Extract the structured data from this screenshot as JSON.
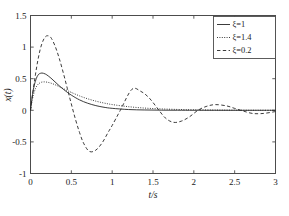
{
  "chart_data": {
    "type": "line",
    "title": "",
    "xlabel": "t/s",
    "ylabel": "x(t)",
    "xlim": [
      0,
      3
    ],
    "ylim": [
      -1,
      1.5
    ],
    "grid": false,
    "legend_position": "upper-right",
    "xticks": [
      "0",
      "0.5",
      "1",
      "1.5",
      "2",
      "2.5",
      "3"
    ],
    "xtick_values": [
      0,
      0.5,
      1,
      1.5,
      2,
      2.5,
      3
    ],
    "yticks": [
      "1.5",
      "1",
      "0.5",
      "0",
      "-0.5",
      "-1"
    ],
    "ytick_values": [
      1.5,
      1,
      0.5,
      0,
      -0.5,
      -1
    ],
    "series": [
      {
        "name": "ξ=1",
        "zeta": 1,
        "style": "solid",
        "color": "#262626",
        "peak_value": 0.59,
        "peak_time": 0.14,
        "x": [
          0,
          0.02,
          0.04,
          0.06,
          0.08,
          0.1,
          0.12,
          0.14,
          0.16,
          0.18,
          0.2,
          0.25,
          0.3,
          0.35,
          0.4,
          0.45,
          0.5,
          0.6,
          0.7,
          0.8,
          0.9,
          1.0,
          1.2,
          1.4,
          1.6,
          1.8,
          2.0,
          2.25,
          2.5,
          2.75,
          3.0
        ],
        "y": [
          0,
          0.21,
          0.36,
          0.46,
          0.53,
          0.57,
          0.585,
          0.59,
          0.585,
          0.575,
          0.56,
          0.51,
          0.45,
          0.39,
          0.335,
          0.285,
          0.24,
          0.165,
          0.112,
          0.074,
          0.048,
          0.031,
          0.012,
          0.005,
          0.002,
          0.001,
          0.0004,
          0.0001,
          5e-05,
          2e-05,
          1e-05
        ]
      },
      {
        "name": "ξ=1.4",
        "zeta": 1.4,
        "style": "dotted",
        "color": "#262626",
        "peak_value": 0.45,
        "peak_time": 0.17,
        "x": [
          0,
          0.02,
          0.04,
          0.06,
          0.08,
          0.1,
          0.13,
          0.17,
          0.21,
          0.25,
          0.3,
          0.35,
          0.4,
          0.45,
          0.5,
          0.6,
          0.7,
          0.8,
          0.9,
          1.0,
          1.2,
          1.4,
          1.6,
          1.8,
          2.0,
          2.25,
          2.5,
          2.75,
          3.0
        ],
        "y": [
          0,
          0.155,
          0.265,
          0.34,
          0.39,
          0.42,
          0.443,
          0.45,
          0.443,
          0.43,
          0.405,
          0.375,
          0.345,
          0.313,
          0.283,
          0.228,
          0.182,
          0.145,
          0.115,
          0.091,
          0.057,
          0.035,
          0.022,
          0.0135,
          0.0084,
          0.0044,
          0.0023,
          0.0012,
          0.0006
        ]
      },
      {
        "name": "ξ=0.2",
        "zeta": 0.2,
        "style": "dashed",
        "color": "#262626",
        "peak_value": 1.18,
        "peak_time": 0.21,
        "trough_value": -0.65,
        "trough_time": 0.72,
        "second_peak": 0.33,
        "second_peak_time": 1.24,
        "second_trough": -0.19,
        "second_trough_time": 1.75,
        "third_peak": 0.09,
        "third_peak_time": 2.26,
        "x": [
          0,
          0.03,
          0.06,
          0.09,
          0.12,
          0.15,
          0.18,
          0.21,
          0.25,
          0.3,
          0.35,
          0.4,
          0.45,
          0.5,
          0.55,
          0.6,
          0.65,
          0.72,
          0.8,
          0.88,
          0.95,
          1.0,
          1.1,
          1.24,
          1.35,
          1.45,
          1.55,
          1.65,
          1.75,
          1.85,
          1.95,
          2.05,
          2.15,
          2.26,
          2.4,
          2.5,
          2.6,
          2.72,
          2.85,
          3.0
        ],
        "y": [
          0,
          0.29,
          0.56,
          0.79,
          0.97,
          1.09,
          1.16,
          1.18,
          1.15,
          1.02,
          0.83,
          0.6,
          0.35,
          0.1,
          -0.14,
          -0.35,
          -0.52,
          -0.65,
          -0.63,
          -0.51,
          -0.35,
          -0.24,
          0.0,
          0.33,
          0.3,
          0.2,
          0.04,
          -0.12,
          -0.19,
          -0.17,
          -0.1,
          0.0,
          0.06,
          0.09,
          0.07,
          0.03,
          -0.01,
          -0.05,
          -0.05,
          -0.02
        ]
      }
    ]
  },
  "legend": {
    "entries": [
      {
        "label": "ξ=1",
        "style": "solid"
      },
      {
        "label": "ξ=1.4",
        "style": "dotted"
      },
      {
        "label": "ξ=0.2",
        "style": "dashed"
      }
    ]
  },
  "axes": {
    "xlabel": "t/s",
    "ylabel": "x(t)"
  }
}
